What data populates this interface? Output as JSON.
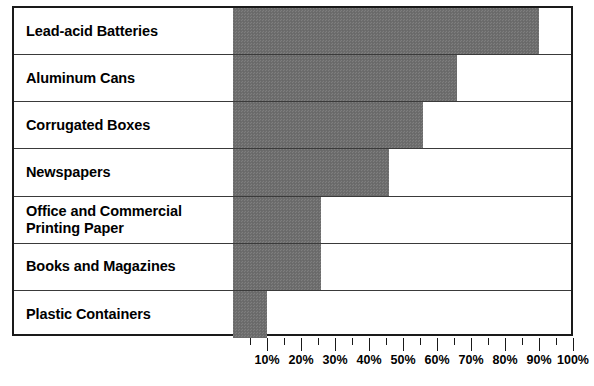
{
  "chart_data": {
    "type": "bar",
    "orientation": "horizontal",
    "title": "",
    "xlabel": "",
    "ylabel": "",
    "xlim": [
      0,
      100
    ],
    "grid": false,
    "legend": null,
    "value_unit": "%",
    "bar_color": "#6e6e6e",
    "frame_color": "#1a1a1a",
    "categories": [
      "Lead-acid Batteries",
      "Aluminum Cans",
      "Corrugated Boxes",
      "Newspapers",
      "Office and Commercial Printing Paper",
      "Books and Magazines",
      "Plastic Containers"
    ],
    "values": [
      90,
      66,
      56,
      46,
      26,
      26,
      10
    ],
    "tick_labels": [
      "10%",
      "20%",
      "30%",
      "40%",
      "50%",
      "60%",
      "70%",
      "80%",
      "90%",
      "100%"
    ],
    "tick_values": [
      10,
      20,
      30,
      40,
      50,
      60,
      70,
      80,
      90,
      100
    ],
    "minor_tick_values": [
      5,
      15,
      25,
      35,
      45,
      55,
      65,
      75,
      85,
      95
    ]
  },
  "rows": [
    {
      "label": "Lead-acid Batteries",
      "label_line1": "Lead-acid Batteries",
      "label_line2": "",
      "value": 90
    },
    {
      "label": "Aluminum Cans",
      "label_line1": "Aluminum Cans",
      "label_line2": "",
      "value": 66
    },
    {
      "label": "Corrugated Boxes",
      "label_line1": "Corrugated Boxes",
      "label_line2": "",
      "value": 56
    },
    {
      "label": "Newspapers",
      "label_line1": "Newspapers",
      "label_line2": "",
      "value": 46
    },
    {
      "label": "Office and Commercial Printing Paper",
      "label_line1": "Office and Commercial",
      "label_line2": "Printing Paper",
      "value": 26
    },
    {
      "label": "Books and Magazines",
      "label_line1": "Books and Magazines",
      "label_line2": "",
      "value": 26
    },
    {
      "label": "Plastic Containers",
      "label_line1": "Plastic Containers",
      "label_line2": "",
      "value": 10
    }
  ]
}
